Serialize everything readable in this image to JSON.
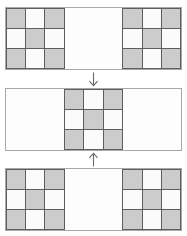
{
  "diagram": {
    "colors": {
      "filled_cell": "#cccccc",
      "empty_cell": "#fbfbfb",
      "grid_line": "#5e5e5e",
      "panel_border": "#a8a8a8",
      "arrow": "#6a6a6a",
      "background": "#ffffff"
    },
    "grid": {
      "columns": 9,
      "rows": 3,
      "block_size": 3,
      "pattern_name": "checkerboard",
      "pattern": [
        [
          1,
          0,
          1
        ],
        [
          0,
          1,
          0
        ],
        [
          1,
          0,
          1
        ]
      ]
    },
    "panels": [
      {
        "id": "panel-top",
        "name": "top-panel",
        "label": "State 1",
        "block_positions": [
          "left",
          "right"
        ],
        "occupied_columns": [
          0,
          1,
          2,
          6,
          7,
          8
        ]
      },
      {
        "id": "panel-mid",
        "name": "middle-panel",
        "label": "State 2",
        "block_positions": [
          "center"
        ],
        "occupied_columns": [
          3,
          4,
          5
        ]
      },
      {
        "id": "panel-bottom",
        "name": "bottom-panel",
        "label": "State 3",
        "block_positions": [
          "left",
          "right"
        ],
        "occupied_columns": [
          0,
          1,
          2,
          6,
          7,
          8
        ]
      }
    ],
    "arrows": [
      {
        "id": "arrow-down",
        "name": "transition-arrow-down",
        "direction": "down",
        "glyph": "↓",
        "from": "panel-top",
        "to": "panel-mid"
      },
      {
        "id": "arrow-up",
        "name": "transition-arrow-up",
        "direction": "up",
        "glyph": "↑",
        "from": "panel-bottom",
        "to": "panel-mid"
      }
    ]
  }
}
